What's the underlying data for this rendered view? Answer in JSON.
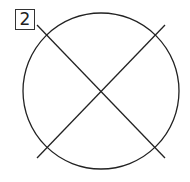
{
  "diagram": {
    "label": "2",
    "stroke_color": "#222222",
    "circle": {
      "cx": 101,
      "cy": 91,
      "r": 78
    },
    "lines": [
      {
        "x1": 37,
        "y1": 25,
        "x2": 165,
        "y2": 158
      },
      {
        "x1": 37,
        "y1": 158,
        "x2": 165,
        "y2": 25
      }
    ]
  }
}
